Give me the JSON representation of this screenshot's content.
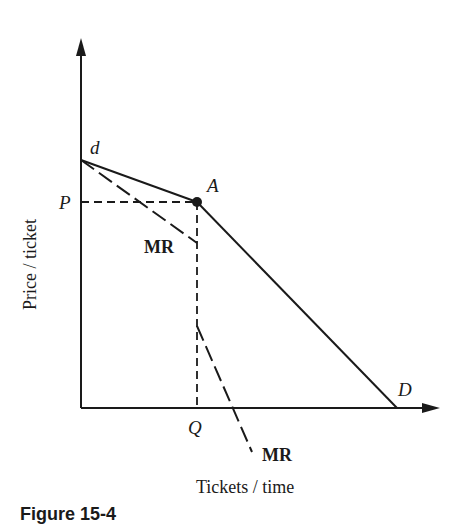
{
  "figure": {
    "caption": "Figure 15-4",
    "x_axis_label": "Tickets / time",
    "y_axis_label": "Price / ticket"
  },
  "labels": {
    "d": "d",
    "A": "A",
    "P": "P",
    "Q": "Q",
    "D": "D",
    "mr_upper": "MR",
    "mr_lower": "MR"
  },
  "colors": {
    "ink": "#1a1a1a",
    "background": "#ffffff"
  },
  "geometry": {
    "origin": [
      81,
      408
    ],
    "y_axis_top": [
      81,
      40
    ],
    "x_axis_end": [
      440,
      408
    ],
    "point_d": [
      81,
      160
    ],
    "point_A": [
      197,
      202
    ],
    "point_D": [
      397,
      408
    ],
    "mr_upper_end": [
      197,
      243
    ],
    "mr_lower_start": [
      197,
      326
    ],
    "mr_lower_end": [
      252,
      452
    ]
  }
}
